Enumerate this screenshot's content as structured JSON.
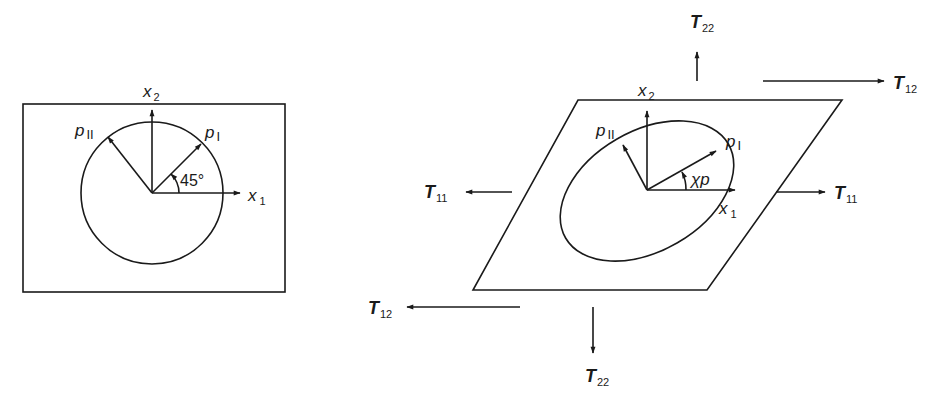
{
  "diagram": {
    "left_panel": {
      "description": "Undeformed square element with circle and principal directions",
      "axes": {
        "x1": {
          "base": "x",
          "sub": "1"
        },
        "x2": {
          "base": "x",
          "sub": "2"
        }
      },
      "vectors": [
        {
          "base": "p",
          "sub": "I"
        },
        {
          "base": "p",
          "sub": "II"
        }
      ],
      "angle_label": "45°"
    },
    "right_panel": {
      "description": "Sheared element with ellipse, principal directions and applied stresses",
      "axes": {
        "x1": {
          "base": "x",
          "sub": "1"
        },
        "x2": {
          "base": "x",
          "sub": "2"
        }
      },
      "vectors": [
        {
          "base": "p",
          "sub": "I"
        },
        {
          "base": "p",
          "sub": "II"
        }
      ],
      "angle_label": "χp",
      "stresses": [
        {
          "id": "T22_top",
          "base": "T",
          "sub": "22",
          "direction": "up"
        },
        {
          "id": "T12_top",
          "base": "T",
          "sub": "12",
          "direction": "right"
        },
        {
          "id": "T11_left",
          "base": "T",
          "sub": "11",
          "direction": "left"
        },
        {
          "id": "T11_right",
          "base": "T",
          "sub": "11",
          "direction": "right"
        },
        {
          "id": "T12_bottom",
          "base": "T",
          "sub": "12",
          "direction": "left"
        },
        {
          "id": "T22_bottom",
          "base": "T",
          "sub": "22",
          "direction": "down"
        }
      ]
    },
    "colors": {
      "ink": "#1a1a1a",
      "background": "#ffffff"
    }
  }
}
